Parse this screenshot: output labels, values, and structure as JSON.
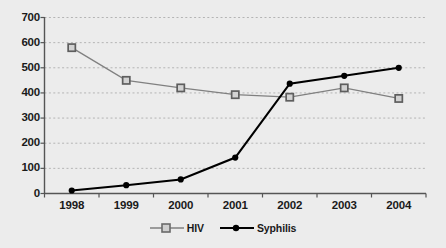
{
  "chart_data": {
    "type": "line",
    "title": "",
    "xlabel": "",
    "ylabel": "",
    "categories": [
      "1998",
      "1999",
      "2000",
      "2001",
      "2002",
      "2003",
      "2004"
    ],
    "series": [
      {
        "name": "HIV",
        "color": "#808080",
        "marker": "square-open",
        "values": [
          580,
          450,
          420,
          393,
          383,
          420,
          378
        ]
      },
      {
        "name": "Syphilis",
        "color": "#000000",
        "marker": "circle-filled",
        "values": [
          12,
          33,
          56,
          143,
          437,
          468,
          500
        ]
      }
    ],
    "ylim": [
      0,
      700
    ],
    "ytick_labels": [
      "0",
      "100",
      "200",
      "300",
      "400",
      "500",
      "600",
      "700"
    ],
    "ytick_values": [
      0,
      100,
      200,
      300,
      400,
      500,
      600,
      700
    ],
    "grid": "horizontal-dotted",
    "legend_position": "bottom-center",
    "background_color": "#ececec",
    "axis_color": "#555555",
    "gridline_color": "#b4b4b4"
  }
}
